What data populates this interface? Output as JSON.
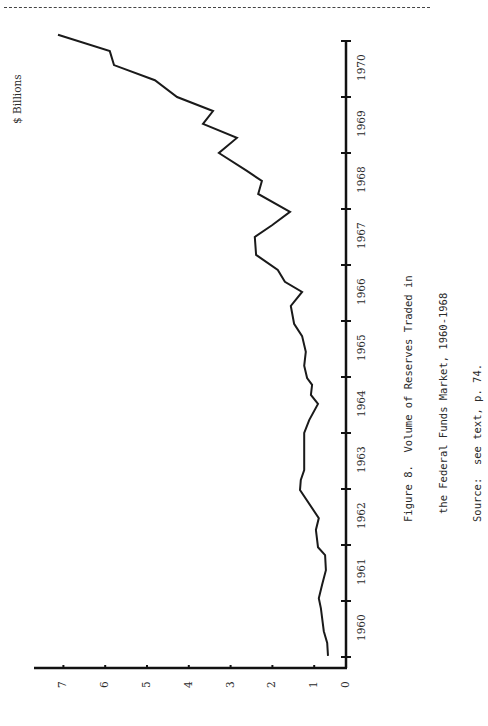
{
  "page": {
    "ylabel_units": "$ Billions"
  },
  "caption": {
    "line1": "Figure 8.  Volume of Reserves Traded in",
    "line2": "the Federal Funds Market, 1960-1968",
    "line3": "Source:  see text, p. 74."
  },
  "chart_data": {
    "type": "line",
    "orientation": "rotated 90° counterclockwise (time axis vertical, values horizontal)",
    "title": "Figure 8. Volume of Reserves Traded in the Federal Funds Market, 1960-1968",
    "source": "Source: see text, p. 74.",
    "xlabel": "",
    "ylabel": "$ Billions",
    "ylim": [
      0,
      7.5
    ],
    "yticks": [
      0,
      1,
      2,
      3,
      4,
      5,
      6,
      7
    ],
    "xlim": [
      1960,
      1971
    ],
    "xtick_labels": [
      "1960",
      "1961",
      "1962",
      "1963",
      "1964",
      "1965",
      "1966",
      "1967",
      "1968",
      "1969",
      "1970"
    ],
    "grid": false,
    "legend": null,
    "series": [
      {
        "name": "Volume of Reserves Traded",
        "x": [
          1960.02,
          1960.25,
          1960.46,
          1960.87,
          1961.05,
          1961.29,
          1961.55,
          1961.82,
          1961.96,
          1962.27,
          1962.48,
          1962.98,
          1963.16,
          1963.34,
          1964.0,
          1964.23,
          1964.52,
          1964.68,
          1964.86,
          1964.98,
          1965.2,
          1965.45,
          1965.73,
          1965.95,
          1966.27,
          1966.52,
          1966.7,
          1966.91,
          1967.18,
          1967.5,
          1967.71,
          1967.95,
          1968.27,
          1968.5,
          1968.68,
          1969.0,
          1969.27,
          1969.52,
          1969.75,
          1970.0,
          1970.3,
          1970.57,
          1970.82,
          1971.11
        ],
        "values": [
          0.67,
          0.69,
          0.77,
          0.84,
          0.89,
          0.81,
          0.72,
          0.74,
          0.91,
          0.96,
          0.89,
          1.34,
          1.32,
          1.24,
          1.24,
          1.12,
          0.91,
          1.08,
          1.05,
          1.17,
          1.24,
          1.2,
          1.29,
          1.48,
          1.56,
          1.29,
          1.7,
          1.87,
          2.39,
          2.42,
          2.01,
          1.58,
          2.34,
          2.25,
          2.61,
          3.28,
          2.85,
          3.66,
          3.42,
          4.28,
          4.81,
          5.79,
          5.89,
          7.13
        ]
      }
    ]
  }
}
